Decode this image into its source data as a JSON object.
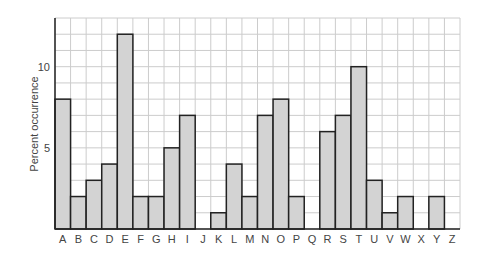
{
  "chart_data": {
    "type": "bar",
    "title": "",
    "xlabel": "",
    "ylabel": "Percent occurrence",
    "categories": [
      "A",
      "B",
      "C",
      "D",
      "E",
      "F",
      "G",
      "H",
      "I",
      "J",
      "K",
      "L",
      "M",
      "N",
      "O",
      "P",
      "Q",
      "R",
      "S",
      "T",
      "U",
      "V",
      "W",
      "X",
      "Y",
      "Z"
    ],
    "values": [
      8,
      2,
      3,
      4,
      12,
      2,
      2,
      5,
      7,
      0,
      1,
      4,
      2,
      7,
      8,
      2,
      0,
      6,
      7,
      10,
      3,
      1,
      2,
      0,
      2,
      0
    ],
    "ylim": [
      0,
      13
    ],
    "yticks": [
      5,
      10
    ],
    "grid": true,
    "legend": null,
    "colors": {
      "bar_fill": "#d3d3d3",
      "bar_stroke": "#222222",
      "grid": "#cccccc",
      "axis": "#222222"
    }
  }
}
